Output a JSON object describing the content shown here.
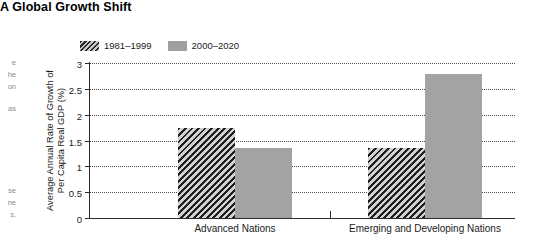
{
  "figure": {
    "title": "A Global Growth Shift"
  },
  "edge_fragments": [
    {
      "text": "e",
      "top": 58
    },
    {
      "text": "he",
      "top": 70
    },
    {
      "text": "on",
      "top": 82
    },
    {
      "text": "as",
      "top": 104
    },
    {
      "text": "se",
      "top": 186
    },
    {
      "text": "ne",
      "top": 198
    },
    {
      "text": "s.",
      "top": 210
    }
  ],
  "chart_data": {
    "type": "bar",
    "title": "A Global Growth Shift",
    "xlabel": "",
    "ylabel": "Average Annual Rate of Growth of Per Capita Real GDP (%)",
    "categories": [
      "Advanced Nations",
      "Emerging and Developing Nations"
    ],
    "series": [
      {
        "name": "1981–1999",
        "values": [
          1.75,
          1.35
        ],
        "fill": "hatched",
        "color": "#8f8f8f"
      },
      {
        "name": "2000–2020",
        "values": [
          1.35,
          2.78
        ],
        "fill": "solid",
        "color": "#a3a3a3"
      }
    ],
    "ylim": [
      0,
      3
    ],
    "yticks": [
      "0",
      "0.5",
      "1",
      "1.5",
      "2",
      "2.5",
      "3"
    ],
    "ytick_values": [
      0,
      0.5,
      1,
      1.5,
      2,
      2.5,
      3
    ],
    "grid": true,
    "grid_style": "dotted",
    "legend_position": "top-left"
  }
}
